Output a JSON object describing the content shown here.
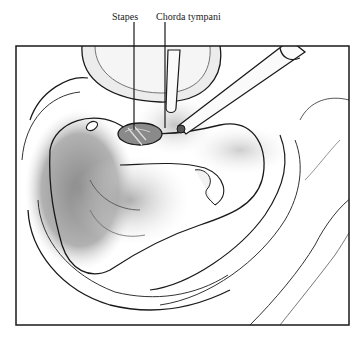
{
  "figure": {
    "labels": [
      {
        "text": "Stapes",
        "x": 113,
        "y": 12
      },
      {
        "text": "Chorda tympani",
        "x": 153,
        "y": 12
      }
    ],
    "colors": {
      "ink": "#1a1a1a",
      "shade_dark": "#7a7a7a",
      "shade_mid": "#a8a8a8",
      "shade_light": "#d6d6d6",
      "paper": "#ffffff"
    }
  }
}
